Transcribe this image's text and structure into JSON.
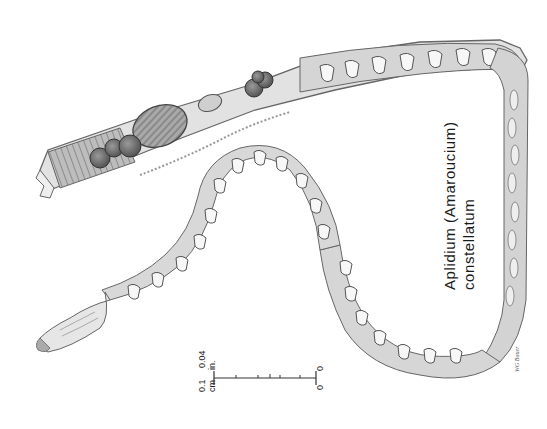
{
  "figure": {
    "species_label": {
      "line1": "Aplidium (Amaroucium)",
      "line2": "constellatum"
    },
    "scale_bar": {
      "top_left_value": "0.1",
      "top_left_unit": "cm",
      "top_right_value": "0.04",
      "top_right_unit": "in.",
      "bottom_left_value": "0",
      "bottom_right_value": "0"
    },
    "signature": "WG Bauer",
    "colors": {
      "background": "#ffffff",
      "outline": "#555555",
      "body_fill": "#d9d9d9",
      "dark_organ": "#6f6f6f",
      "text": "#1a1a1a"
    }
  }
}
